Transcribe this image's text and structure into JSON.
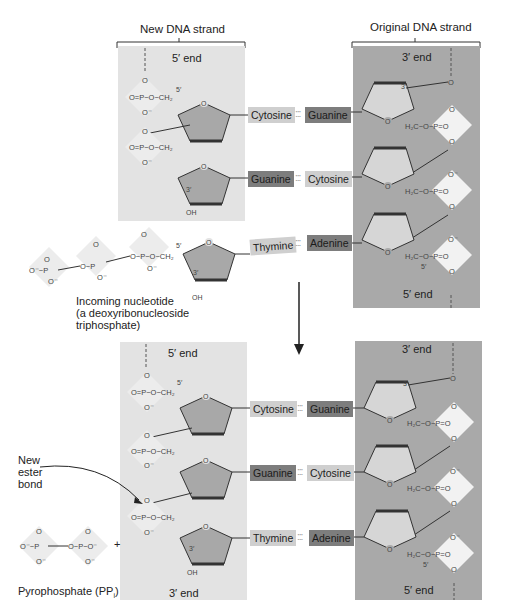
{
  "top": {
    "new_strand_label": "New DNA strand",
    "original_strand_label": "Original DNA strand",
    "new_strand_end_top": "5′ end",
    "original_strand_end_top": "3′ end",
    "original_strand_end_bottom": "5′ end",
    "pairs": [
      {
        "left": "Cytosine",
        "right": "Guanine",
        "left_shade": "light",
        "right_shade": "dark"
      },
      {
        "left": "Guanine",
        "right": "Cytosine",
        "left_shade": "dark",
        "right_shade": "light"
      },
      {
        "left": "Thymine",
        "right": "Adenine",
        "left_shade": "light",
        "right_shade": "dark"
      }
    ],
    "incoming_label_line1": "Incoming nucleotide",
    "incoming_label_line2": "(a deoxyribonucleoside",
    "incoming_label_line3": "triphosphate)"
  },
  "bottom": {
    "new_strand_end_top": "5′ end",
    "new_strand_end_bottom": "3′ end",
    "original_strand_end_top": "3′ end",
    "original_strand_end_bottom": "5′ end",
    "pairs": [
      {
        "left": "Cytosine",
        "right": "Guanine",
        "left_shade": "light",
        "right_shade": "dark"
      },
      {
        "left": "Guanine",
        "right": "Cytosine",
        "left_shade": "dark",
        "right_shade": "light"
      },
      {
        "left": "Thymine",
        "right": "Adenine",
        "left_shade": "light",
        "right_shade": "dark"
      }
    ],
    "new_bond_line1": "New",
    "new_bond_line2": "ester",
    "new_bond_line3": "bond",
    "pyrophosphate_label": "Pyrophosphate (PP",
    "pyrophosphate_sub": "i",
    "pyrophosphate_close": ")",
    "plus": "+"
  },
  "chem": {
    "phosphate_o": "O",
    "phosphate_p": "P",
    "o_minus": "O⁻",
    "ch2": "CH₂",
    "h2c": "H₂C",
    "oh": "OH",
    "prime5": "5′",
    "prime3": "3′",
    "hbond": ":::"
  },
  "colors": {
    "new_strand_bg": "#e3e3e3",
    "original_strand_bg": "#a9a9a9",
    "sugar_fill": "#a8a8a8",
    "sugar_fill_light": "#d6d6d6",
    "phosphate_diamond": "#ececec",
    "base_light": "#cfcfcf",
    "base_dark": "#7d7d7d"
  }
}
